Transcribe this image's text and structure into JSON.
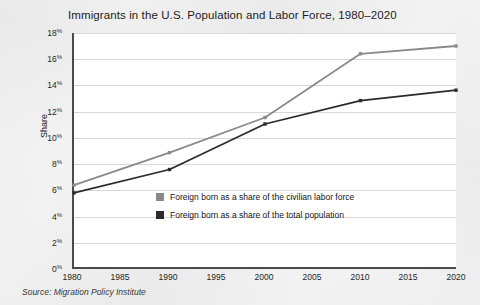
{
  "chart_data": {
    "type": "line",
    "title": "Immigrants in the U.S. Population and Labor Force, 1980–2020",
    "xlabel": "",
    "ylabel": "Share",
    "x": [
      1980,
      1990,
      2000,
      2010,
      2020
    ],
    "xlim": [
      1980,
      2020
    ],
    "xticks": [
      "1980",
      "1985",
      "1990",
      "1995",
      "2000",
      "2005",
      "2010",
      "2015",
      "2020"
    ],
    "xtick_values": [
      1980,
      1985,
      1990,
      1995,
      2000,
      2005,
      2010,
      2015,
      2020
    ],
    "ylim": [
      0,
      18
    ],
    "yticks": [
      "0",
      "2",
      "4",
      "6",
      "8",
      "10",
      "12",
      "14",
      "16",
      "18"
    ],
    "ytick_suffix": "%",
    "ytick_values": [
      0,
      2,
      4,
      6,
      8,
      10,
      12,
      14,
      16,
      18
    ],
    "grid": "horizontal",
    "legend_position": "inside-bottom-right",
    "series": [
      {
        "name": "Foreign born as a share of the civilian labor force",
        "color": "#8a8a8a",
        "values": [
          6.3,
          8.8,
          11.5,
          16.4,
          17.0
        ]
      },
      {
        "name": "Foreign born as a share of the total population",
        "color": "#2b2b2b",
        "values": [
          5.7,
          7.5,
          11.0,
          12.8,
          13.6
        ]
      }
    ],
    "source": "Source: Migration Policy Institute"
  },
  "colors": {
    "page_background": "#f3f3f3",
    "plot_background": "#ffffff",
    "axis": "#4b4b4b",
    "gridline": "#d8d8d8",
    "series_labor_force": "#8a8a8a",
    "series_total_population": "#2b2b2b",
    "text": "#1c1c1c"
  }
}
